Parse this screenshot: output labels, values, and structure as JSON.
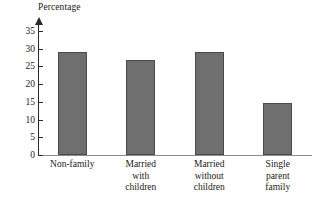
{
  "chart_data": {
    "type": "bar",
    "title": "",
    "ylabel": "Percentage",
    "xlabel": "",
    "categories": [
      "Non-family",
      "Married with children",
      "Married without children",
      "Single parent family"
    ],
    "category_lines": [
      [
        "Non-family"
      ],
      [
        "Married",
        "with",
        "children"
      ],
      [
        "Married",
        "without",
        "children"
      ],
      [
        "Single",
        "parent",
        "family"
      ]
    ],
    "values": [
      29,
      26.7,
      29,
      14.7
    ],
    "ylim": [
      0,
      37
    ],
    "yticks": [
      0,
      5,
      10,
      15,
      20,
      25,
      30,
      35
    ],
    "ytick_labels": [
      "0",
      "5",
      "10",
      "15",
      "20",
      "25",
      "30",
      "35"
    ],
    "grid": false,
    "legend": null,
    "bar_color": "#6f6f6f",
    "bar_border_color": "#4a4a4a",
    "axis_color": "#2a2a2a",
    "baseline_color": "#8d8d8d"
  }
}
